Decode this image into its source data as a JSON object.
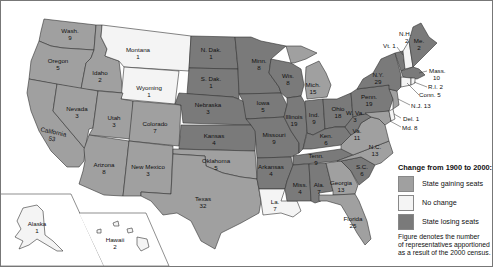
{
  "colors": {
    "gaining": "#a0a0a0",
    "no_change": "#f4f4f4",
    "losing": "#7a7a7a",
    "water": "#ffffff",
    "border": "#333333"
  },
  "legend": {
    "title": "Change from 1900 to 2000:",
    "items": [
      {
        "key": "gaining",
        "label": "State gaining seats"
      },
      {
        "key": "no_change",
        "label": "No change"
      },
      {
        "key": "losing",
        "label": "State losing seats"
      }
    ],
    "note_lines": [
      "Figure denotes the number",
      "of representatives apportioned",
      "as a result of the 2000 census."
    ]
  },
  "states": {
    "wash": {
      "name": "Wash.",
      "seats": "9",
      "status": "gaining"
    },
    "oregon": {
      "name": "Oregon",
      "seats": "5",
      "status": "gaining"
    },
    "california": {
      "name": "California",
      "seats": "53",
      "status": "gaining"
    },
    "idaho": {
      "name": "Idaho",
      "seats": "2",
      "status": "gaining"
    },
    "nevada": {
      "name": "Nevada",
      "seats": "3",
      "status": "gaining"
    },
    "montana": {
      "name": "Montana",
      "seats": "1",
      "status": "no_change"
    },
    "wyoming": {
      "name": "Wyoming",
      "seats": "1",
      "status": "no_change"
    },
    "utah": {
      "name": "Utah",
      "seats": "3",
      "status": "gaining"
    },
    "colorado": {
      "name": "Colorado",
      "seats": "7",
      "status": "gaining"
    },
    "arizona": {
      "name": "Arizona",
      "seats": "8",
      "status": "gaining"
    },
    "new_mexico": {
      "name": "New Mexico",
      "seats": "3",
      "status": "gaining"
    },
    "n_dak": {
      "name": "N. Dak.",
      "seats": "1",
      "status": "losing"
    },
    "s_dak": {
      "name": "S. Dak.",
      "seats": "1",
      "status": "losing"
    },
    "nebraska": {
      "name": "Nebraska",
      "seats": "3",
      "status": "losing"
    },
    "kansas": {
      "name": "Kansas",
      "seats": "4",
      "status": "losing"
    },
    "oklahoma": {
      "name": "Oklahoma",
      "seats": "5",
      "status": "gaining"
    },
    "texas": {
      "name": "Texas",
      "seats": "32",
      "status": "gaining"
    },
    "minn": {
      "name": "Minn.",
      "seats": "8",
      "status": "losing"
    },
    "iowa": {
      "name": "Iowa",
      "seats": "5",
      "status": "losing"
    },
    "missouri": {
      "name": "Missouri",
      "seats": "9",
      "status": "losing"
    },
    "arkansas": {
      "name": "Arkansas",
      "seats": "4",
      "status": "losing"
    },
    "la": {
      "name": "La.",
      "seats": "7",
      "status": "no_change"
    },
    "wis": {
      "name": "Wis.",
      "seats": "8",
      "status": "losing"
    },
    "illinois": {
      "name": "Illinois",
      "seats": "19",
      "status": "losing"
    },
    "mich": {
      "name": "Mich.",
      "seats": "15",
      "status": "gaining"
    },
    "ind": {
      "name": "Ind.",
      "seats": "9",
      "status": "losing"
    },
    "ohio": {
      "name": "Ohio",
      "seats": "18",
      "status": "losing"
    },
    "ken": {
      "name": "Ken.",
      "seats": "6",
      "status": "losing"
    },
    "tenn": {
      "name": "Tenn.",
      "seats": "9",
      "status": "losing"
    },
    "miss": {
      "name": "Miss.",
      "seats": "4",
      "status": "losing"
    },
    "ala": {
      "name": "Ala.",
      "seats": "7",
      "status": "losing"
    },
    "georgia": {
      "name": "Georgia",
      "seats": "13",
      "status": "gaining"
    },
    "florida": {
      "name": "Florida",
      "seats": "25",
      "status": "gaining"
    },
    "s_c": {
      "name": "S.C.",
      "seats": "6",
      "status": "losing"
    },
    "n_c": {
      "name": "N.C.",
      "seats": "13",
      "status": "gaining"
    },
    "va": {
      "name": "Va.",
      "seats": "11",
      "status": "gaining"
    },
    "w_va": {
      "name": "W. Va.",
      "seats": "3",
      "status": "losing"
    },
    "penn": {
      "name": "Penn.",
      "seats": "19",
      "status": "losing"
    },
    "n_y": {
      "name": "N.Y.",
      "seats": "29",
      "status": "losing"
    },
    "vt": {
      "name": "Vt.",
      "seats": "1",
      "status": "losing"
    },
    "n_h": {
      "name": "N.H.",
      "seats": "2",
      "status": "no_change"
    },
    "me": {
      "name": "Me.",
      "seats": "2",
      "status": "losing"
    },
    "mass": {
      "name": "Mass.",
      "seats": "10",
      "status": "losing"
    },
    "r_i": {
      "name": "R.I.",
      "seats": "2",
      "status": "no_change"
    },
    "conn": {
      "name": "Conn.",
      "seats": "5",
      "status": "no_change"
    },
    "n_j": {
      "name": "N.J.",
      "seats": "13",
      "status": "gaining"
    },
    "del": {
      "name": "Del.",
      "seats": "1",
      "status": "no_change"
    },
    "md": {
      "name": "Md.",
      "seats": "8",
      "status": "gaining"
    },
    "alaska": {
      "name": "Alaska",
      "seats": "1",
      "status": "no_change"
    },
    "hawaii": {
      "name": "Hawaii",
      "seats": "2",
      "status": "no_change"
    }
  }
}
